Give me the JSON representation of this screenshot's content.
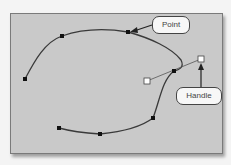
{
  "diagram": {
    "title": "",
    "labels": {
      "point": "Point",
      "handle": "Handle"
    },
    "colors": {
      "background": "#c9c9c9",
      "curve": "#3a3a3a",
      "anchor": "#111111",
      "handle_fill": "#ffffff",
      "callout_fill": "#f7f7f7"
    },
    "anchor_points": [
      {
        "x": 25,
        "y": 79
      },
      {
        "x": 62,
        "y": 36
      },
      {
        "x": 128,
        "y": 32
      },
      {
        "x": 174,
        "y": 71
      },
      {
        "x": 153,
        "y": 118
      },
      {
        "x": 100,
        "y": 134
      },
      {
        "x": 59,
        "y": 128
      }
    ],
    "handles": [
      {
        "x": 147,
        "y": 81
      },
      {
        "x": 201,
        "y": 59
      }
    ]
  }
}
